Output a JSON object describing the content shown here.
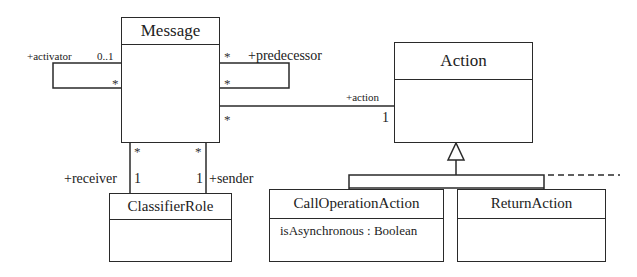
{
  "diagram": {
    "type": "UML class diagram",
    "classes": {
      "message": {
        "name": "Message",
        "attributes": []
      },
      "action": {
        "name": "Action",
        "attributes": []
      },
      "classifier_role": {
        "name": "ClassifierRole",
        "attributes": []
      },
      "call_operation_action": {
        "name": "CallOperationAction",
        "attributes": [
          "isAsynchronous : Boolean"
        ]
      },
      "return_action": {
        "name": "ReturnAction",
        "attributes": []
      }
    },
    "associations": {
      "activator": {
        "role": "+activator",
        "mult_source": "0..1",
        "mult_target": "*"
      },
      "predecessor": {
        "role": "+predecessor",
        "mult_source": "*",
        "mult_target": "*"
      },
      "action": {
        "role": "+action",
        "mult_message": "*",
        "mult_action": "1"
      },
      "receiver": {
        "role": "+receiver",
        "mult_message": "*",
        "mult_role": "1"
      },
      "sender": {
        "role": "+sender",
        "mult_message": "*",
        "mult_role": "1"
      }
    },
    "generalization": {
      "parent": "Action",
      "children": [
        "CallOperationAction",
        "ReturnAction"
      ]
    }
  }
}
